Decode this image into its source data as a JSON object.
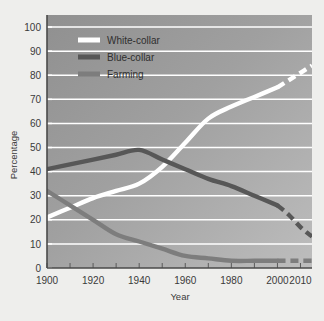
{
  "chart_data": {
    "type": "line",
    "title": "",
    "xlabel": "Year",
    "ylabel": "Percentage",
    "xlim": [
      1900,
      2015
    ],
    "ylim": [
      0,
      105
    ],
    "ytick_labels": [
      "0",
      "10",
      "20",
      "30",
      "40",
      "50",
      "60",
      "70",
      "80",
      "90",
      "100"
    ],
    "ytick_values": [
      0,
      10,
      20,
      30,
      40,
      50,
      60,
      70,
      80,
      90,
      100
    ],
    "xtick_labels": [
      "1900",
      "1920",
      "1940",
      "1960",
      "1980",
      "2000",
      "2010"
    ],
    "xtick_values": [
      1900,
      1920,
      1940,
      1960,
      1980,
      2000,
      2010
    ],
    "minor_xticks": [
      1900,
      1910,
      1920,
      1930,
      1940,
      1950,
      1960,
      1970,
      1980,
      1990,
      2000,
      2010
    ],
    "grid": "horizontal-white",
    "legend_position": "top-left-inside",
    "series": [
      {
        "name": "White-collar",
        "color": "#ffffff",
        "solid_x": [
          1900,
          1910,
          1920,
          1930,
          1940,
          1950,
          1960,
          1970,
          1980,
          1990,
          2000
        ],
        "solid_values": [
          21,
          25,
          29,
          32,
          35,
          42,
          52,
          62,
          67,
          71,
          75
        ],
        "dashed_x": [
          2000,
          2005,
          2010,
          2015
        ],
        "dashed_values": [
          75,
          78,
          81,
          84
        ]
      },
      {
        "name": "Blue-collar",
        "color": "#575757",
        "solid_x": [
          1900,
          1910,
          1920,
          1930,
          1940,
          1950,
          1960,
          1970,
          1980,
          1990,
          2000
        ],
        "solid_values": [
          41,
          43,
          45,
          47,
          49,
          45,
          41,
          37,
          34,
          30,
          26
        ],
        "dashed_x": [
          2000,
          2005,
          2010,
          2015
        ],
        "dashed_values": [
          26,
          22,
          17,
          13
        ]
      },
      {
        "name": "Farming",
        "color": "#7d7d7d",
        "solid_x": [
          1900,
          1910,
          1920,
          1930,
          1940,
          1950,
          1960,
          1970,
          1980,
          1990,
          2000
        ],
        "solid_values": [
          32,
          26,
          20,
          14,
          11,
          8,
          5,
          4,
          3,
          3,
          3
        ],
        "dashed_x": [
          2000,
          2005,
          2010,
          2015
        ],
        "dashed_values": [
          3,
          3,
          3,
          3
        ]
      }
    ]
  },
  "legend": {
    "items": [
      {
        "label": "White-collar",
        "color": "#ffffff"
      },
      {
        "label": "Blue-collar",
        "color": "#575757"
      },
      {
        "label": "Farming",
        "color": "#7d7d7d"
      }
    ]
  },
  "colors": {
    "page_background": "#eeeeec",
    "plot_background_dark": "#969696",
    "plot_background_light": "#b4b4b4",
    "gridline": "#ffffff",
    "axis": "#4a4a4a",
    "text": "#3a3a3a"
  }
}
